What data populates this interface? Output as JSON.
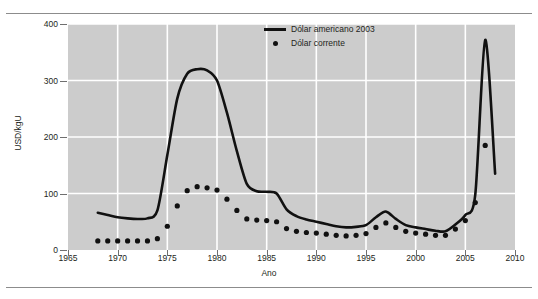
{
  "chart_data": {
    "type": "line",
    "title": "",
    "xlabel": "Ano",
    "ylabel": "USD/kgU",
    "xlim": [
      1965,
      2010
    ],
    "ylim": [
      0,
      400
    ],
    "xticks": [
      1965,
      1970,
      1975,
      1980,
      1985,
      1990,
      1995,
      2000,
      2005,
      2010
    ],
    "yticks": [
      0,
      100,
      200,
      300,
      400
    ],
    "grid": true,
    "legend_position": "top-center",
    "plot_background": "#cccccc",
    "gridline_color": "#ffffff",
    "series": [
      {
        "name": "Dólar americano 2003",
        "type": "line",
        "color": "#111111",
        "x": [
          1968,
          1969,
          1970,
          1971,
          1972,
          1973,
          1974,
          1975,
          1976,
          1977,
          1978,
          1979,
          1980,
          1981,
          1982,
          1983,
          1984,
          1985,
          1986,
          1987,
          1988,
          1989,
          1990,
          1991,
          1992,
          1993,
          1994,
          1995,
          1996,
          1997,
          1998,
          1999,
          2000,
          2001,
          2002,
          2003,
          2004,
          2005,
          2006,
          2007,
          2008
        ],
        "values": [
          66,
          62,
          58,
          56,
          55,
          56,
          70,
          168,
          268,
          312,
          320,
          318,
          300,
          243,
          175,
          117,
          104,
          103,
          100,
          72,
          60,
          54,
          50,
          46,
          42,
          40,
          41,
          44,
          58,
          68,
          55,
          44,
          40,
          37,
          34,
          33,
          45,
          62,
          98,
          372,
          135
        ]
      },
      {
        "name": "Dólar corrente",
        "type": "scatter",
        "color": "#111111",
        "x": [
          1968,
          1969,
          1970,
          1971,
          1972,
          1973,
          1974,
          1975,
          1976,
          1977,
          1978,
          1979,
          1980,
          1981,
          1982,
          1983,
          1984,
          1985,
          1986,
          1987,
          1988,
          1989,
          1990,
          1991,
          1992,
          1993,
          1994,
          1995,
          1996,
          1997,
          1998,
          1999,
          2000,
          2001,
          2002,
          2003,
          2004,
          2005,
          2006,
          2007
        ],
        "values": [
          16,
          16,
          16,
          16,
          16,
          16,
          20,
          42,
          78,
          105,
          112,
          110,
          106,
          90,
          70,
          55,
          53,
          52,
          50,
          38,
          33,
          31,
          30,
          28,
          26,
          25,
          26,
          29,
          40,
          48,
          40,
          33,
          30,
          28,
          26,
          26,
          37,
          52,
          84,
          185
        ]
      }
    ]
  },
  "legend": {
    "items": [
      {
        "label": "Dólar americano 2003",
        "marker": "line"
      },
      {
        "label": "Dólar corrente",
        "marker": "dot"
      }
    ]
  }
}
